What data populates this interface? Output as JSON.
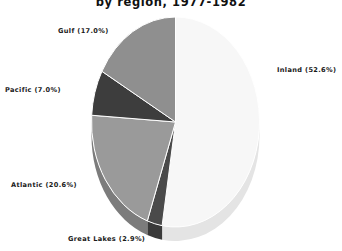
{
  "chart_data": {
    "type": "pie",
    "title": "by region, 1977-1982",
    "title_full": "by region, 1977-1982",
    "categories": [
      "Inland",
      "Great Lakes",
      "Atlantic",
      "Pacific",
      "Gulf"
    ],
    "values": [
      52.6,
      2.9,
      20.6,
      7.0,
      17.0
    ],
    "labels": [
      "Inland (52.6%)",
      "Great Lakes (2.9%)",
      "Atlantic (20.6%)",
      "Pacific (7.0%)",
      "Gulf (17.0%)"
    ],
    "colors": [
      "#f7f7f7",
      "#4a4a4a",
      "#9a9a9a",
      "#3d3d3d",
      "#8f8f8f"
    ],
    "side_colors": [
      "#e2e2e2",
      "#3a3a3a",
      "#7c7c7c",
      "#2e2e2e",
      "#737373"
    ],
    "start_angle_deg": 0,
    "direction": "clockwise",
    "legend": "none",
    "grid": false,
    "unit": "%",
    "xlabel": "",
    "ylabel": ""
  },
  "chart": {
    "title": "by region, 1977-1982",
    "slices": [
      {
        "name": "inland",
        "label": "Inland (52.6%)",
        "value": 52.6,
        "color": "#f7f7f7"
      },
      {
        "name": "great-lakes",
        "label": "Great Lakes (2.9%)",
        "value": 2.9,
        "color": "#4a4a4a"
      },
      {
        "name": "atlantic",
        "label": "Atlantic (20.6%)",
        "value": 20.6,
        "color": "#9a9a9a"
      },
      {
        "name": "pacific",
        "label": "Pacific (7.0%)",
        "value": 7.0,
        "color": "#3d3d3d"
      },
      {
        "name": "gulf",
        "label": "Gulf (17.0%)",
        "value": 17.0,
        "color": "#8f8f8f"
      }
    ]
  }
}
